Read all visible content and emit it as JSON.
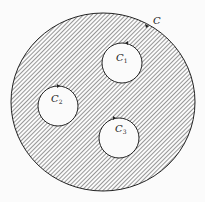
{
  "diagram": {
    "outer_contour": {
      "label": "C",
      "cx": 103,
      "cy": 102,
      "rx": 92,
      "ry": 89
    },
    "inner_contours": [
      {
        "label": "C",
        "subscript": "1",
        "cx": 122,
        "cy": 63,
        "r": 20
      },
      {
        "label": "C",
        "subscript": "2",
        "cx": 58,
        "cy": 106,
        "r": 20
      },
      {
        "label": "C",
        "subscript": "3",
        "cx": 119,
        "cy": 138,
        "r": 20
      }
    ],
    "colors": {
      "hatch": "#333333",
      "background": "#fbfbfb"
    }
  }
}
